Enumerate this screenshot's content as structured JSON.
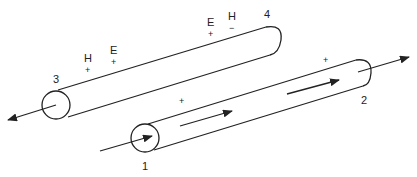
{
  "diagram": {
    "ports": [
      {
        "id": "port-1",
        "label": "1"
      },
      {
        "id": "port-2",
        "label": "2"
      },
      {
        "id": "port-3",
        "label": "3"
      },
      {
        "id": "port-4",
        "label": "4"
      }
    ],
    "field_labels": {
      "upper_left": {
        "h": "H",
        "h_sign": "+",
        "e": "E",
        "e_sign": "+"
      },
      "upper_right": {
        "e": "E",
        "e_sign": "+",
        "h": "H",
        "h_sign": "−"
      },
      "lower_signs": [
        "+",
        "+"
      ]
    },
    "colors": {
      "line": "#222222",
      "background": "#ffffff"
    }
  }
}
